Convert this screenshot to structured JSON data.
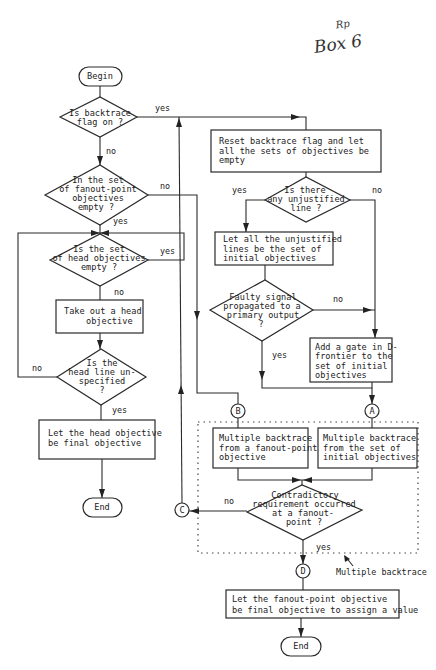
{
  "annotation": {
    "initials": "Rp",
    "label": "Box 6"
  },
  "nodes": {
    "begin": "Begin",
    "backtrace_flag": [
      "Is backtrace",
      "flag on ?"
    ],
    "fanout_empty": [
      "In the set",
      "of fanout-point",
      "objectives",
      "empty ?"
    ],
    "head_empty": [
      "Is the set",
      "of head objectives",
      "empty ?"
    ],
    "take_head": [
      "Take out a head",
      "objective"
    ],
    "head_unspecified": [
      "Is the",
      "head line un-",
      "specified",
      "?"
    ],
    "head_final": [
      "Let the head objective",
      "be final objective"
    ],
    "end_left": "End",
    "reset": [
      "Reset backtrace flag and let",
      "all the sets of objectives be",
      "empty"
    ],
    "unjustified": [
      "Is there",
      "any unjustified",
      "line ?"
    ],
    "let_unjustified": [
      "Let all the unjustified",
      "lines be the set of",
      "initial objectives"
    ],
    "faulty": [
      "Faulty signal",
      "propagated to a",
      "primary output",
      "?"
    ],
    "add_gate": [
      "Add a gate in D-",
      "frontier to the",
      "set of initial",
      "objectives"
    ],
    "mb_fanout": [
      "Multiple backtrace",
      "from a fanout-point",
      "objective"
    ],
    "mb_initial": [
      "Multiple backtrace",
      "from the set of",
      "initial objectives"
    ],
    "contradictory": [
      "Contradictory",
      "requirement occurred",
      "at a fanout-",
      "point ?"
    ],
    "fanout_final": [
      "Let the fanout-point objective",
      "be final objective to assign a value"
    ],
    "end_right": "End"
  },
  "connectors": {
    "A": "A",
    "B": "B",
    "C": "C",
    "D": "D"
  },
  "edge_labels": {
    "backtrace_yes": "yes",
    "backtrace_no": "no",
    "fanout_no": "no",
    "fanout_yes": "yes",
    "head_empty_yes": "yes",
    "head_empty_no": "no",
    "head_unspec_no": "no",
    "head_unspec_yes": "yes",
    "unjustified_yes": "yes",
    "unjustified_no": "no",
    "faulty_no": "no",
    "faulty_yes": "yes",
    "contradictory_no": "no",
    "contradictory_yes": "yes"
  },
  "group_label": "Multiple backtrace"
}
